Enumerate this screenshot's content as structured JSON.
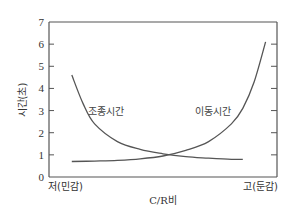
{
  "chart_data": {
    "type": "line",
    "title": "",
    "xlabel": "C/R비",
    "ylabel": "시간(초)",
    "ylim": [
      0,
      7
    ],
    "yticks": [
      0,
      1,
      2,
      3,
      4,
      5,
      6,
      7
    ],
    "x_tick_labels": {
      "low": "저(민감)",
      "high": "고(둔감)"
    },
    "grid": false,
    "legend": "none (curves labeled inline)",
    "series": [
      {
        "name": "조종시간",
        "x": [
          0.1,
          0.15,
          0.2,
          0.3,
          0.4,
          0.5,
          0.6,
          0.7,
          0.8,
          0.85
        ],
        "values": [
          4.6,
          3.3,
          2.4,
          1.6,
          1.25,
          1.05,
          0.92,
          0.85,
          0.8,
          0.8
        ]
      },
      {
        "name": "이동시간",
        "x": [
          0.1,
          0.2,
          0.3,
          0.4,
          0.5,
          0.6,
          0.7,
          0.8,
          0.85,
          0.9,
          0.95
        ],
        "values": [
          0.7,
          0.72,
          0.75,
          0.82,
          0.95,
          1.2,
          1.6,
          2.4,
          3.1,
          4.3,
          6.1
        ]
      }
    ],
    "annotations": [
      {
        "text": "조종시간",
        "near_series": "조종시간"
      },
      {
        "text": "이동시간",
        "near_series": "이동시간"
      }
    ],
    "colors": {
      "axis": "#555555",
      "curve": "#555555",
      "text": "#333333"
    }
  },
  "labels": {
    "ylabel": "시간(초)",
    "xlabel": "C/R비",
    "x_low": "저(민감)",
    "x_high": "고(둔감)",
    "curve1": "조종시간",
    "curve2": "이동시간",
    "yticks": [
      "0",
      "1",
      "2",
      "3",
      "4",
      "5",
      "6",
      "7"
    ]
  }
}
